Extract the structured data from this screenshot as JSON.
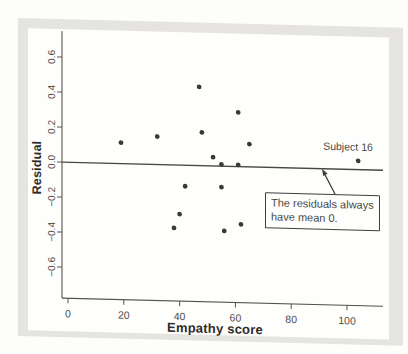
{
  "figure": {
    "y_axis_title": "Residual",
    "x_axis_title": "Empathy score",
    "annotations": {
      "subject_label": "Subject 16",
      "callout_line1": "The residuals always",
      "callout_line2": "have mean 0."
    }
  },
  "colors": {
    "panel_bg": "#e5e4e1",
    "sheet_bg": "#fefefd",
    "axis_ink": "#55534f",
    "zero_line_ink": "#474744",
    "dot_ink": "#3a3936",
    "tick_text": "#504e49",
    "bold_text": "#2e2c28"
  },
  "chart_data": {
    "type": "scatter",
    "title": "",
    "xlabel": "Empathy score",
    "ylabel": "Residual",
    "xlim": [
      -2,
      113
    ],
    "ylim": [
      -0.78,
      0.76
    ],
    "x_ticks": [
      0,
      20,
      40,
      60,
      80,
      100
    ],
    "y_ticks": [
      0.6,
      0.4,
      0.2,
      0.0,
      -0.2,
      -0.4,
      -0.6
    ],
    "grid": false,
    "zero_line": 0,
    "legend": "none",
    "points": [
      {
        "x": 19,
        "y": 0.12
      },
      {
        "x": 32,
        "y": 0.16
      },
      {
        "x": 47,
        "y": 0.45
      },
      {
        "x": 48,
        "y": 0.19
      },
      {
        "x": 52,
        "y": 0.05
      },
      {
        "x": 55,
        "y": 0.01
      },
      {
        "x": 61,
        "y": 0.01
      },
      {
        "x": 61,
        "y": 0.31
      },
      {
        "x": 65,
        "y": 0.13
      },
      {
        "x": 42,
        "y": -0.12
      },
      {
        "x": 55,
        "y": -0.12
      },
      {
        "x": 40,
        "y": -0.28
      },
      {
        "x": 38,
        "y": -0.36
      },
      {
        "x": 56,
        "y": -0.37
      },
      {
        "x": 62,
        "y": -0.33
      },
      {
        "x": 104,
        "y": 0.05,
        "label": "Subject 16"
      }
    ],
    "annotation_callout": "The residuals always have mean 0."
  }
}
